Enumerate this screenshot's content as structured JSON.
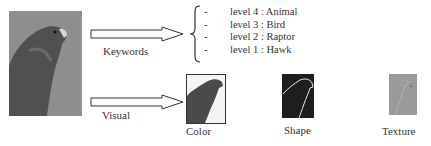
{
  "source_image": {
    "subject": "hawk",
    "icon": "hawk-photo"
  },
  "keywords_arrow": {
    "label": "Keywords"
  },
  "visual_arrow": {
    "label": "Visual"
  },
  "keyword_levels": [
    {
      "bullet": "-",
      "text": "level 4 : Animal"
    },
    {
      "bullet": "-",
      "text": "level 3 : Bird"
    },
    {
      "bullet": "-",
      "text": "level 2 : Raptor"
    },
    {
      "bullet": "-",
      "text": "level 1 : Hawk"
    }
  ],
  "features": [
    {
      "label": "Color",
      "icon": "color-segmentation"
    },
    {
      "label": "Shape",
      "icon": "shape-contour"
    },
    {
      "label": "Texture",
      "icon": "texture-map"
    }
  ],
  "colors": {
    "photo_bg": "#8c8c8c",
    "bird_dark": "#4a4a4a",
    "shape_bg": "#1e1e1e",
    "texture_bg": "#9a9a9a"
  }
}
